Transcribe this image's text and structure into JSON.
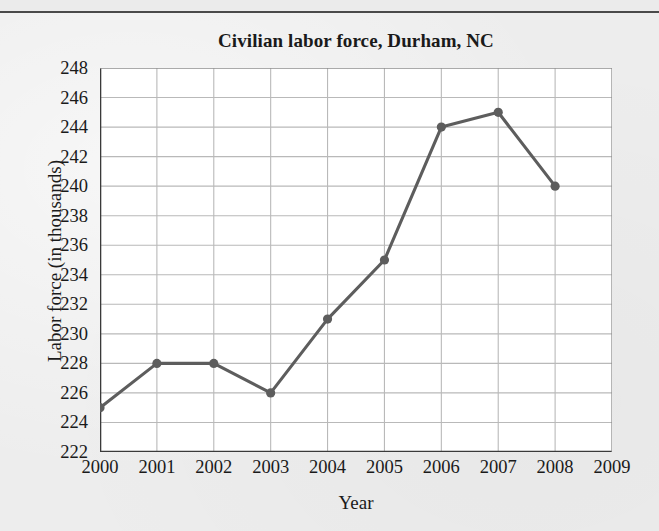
{
  "figure": {
    "background_color": "#ededed",
    "plot_background_color": "#ffffff",
    "axis_color": "#3a3a3a",
    "grid_color": "#b9b9b9",
    "series_color": "#5d5d5d"
  },
  "chart_data": {
    "type": "line",
    "title": "Civilian labor force, Durham, NC",
    "xlabel": "Year",
    "ylabel": "Labor force (in thousands)",
    "x": [
      2000,
      2001,
      2002,
      2003,
      2004,
      2005,
      2006,
      2007,
      2008
    ],
    "values": [
      225,
      228,
      228,
      226,
      231,
      235,
      244,
      245,
      240
    ],
    "series": [
      {
        "name": "Civilian labor force",
        "values": [
          225,
          228,
          228,
          226,
          231,
          235,
          244,
          245,
          240
        ]
      }
    ],
    "xlim": [
      2000,
      2009
    ],
    "ylim": [
      222,
      248
    ],
    "xticks": [
      2000,
      2001,
      2002,
      2003,
      2004,
      2005,
      2006,
      2007,
      2008,
      2009
    ],
    "xtick_labels": [
      "2000",
      "2001",
      "2002",
      "2003",
      "2004",
      "2005",
      "2006",
      "2007",
      "2008",
      "2009"
    ],
    "x_minor_tick_step": 0.5,
    "yticks": [
      222,
      224,
      226,
      228,
      230,
      232,
      234,
      236,
      238,
      240,
      242,
      244,
      246,
      248
    ],
    "ytick_labels": [
      "222",
      "224",
      "226",
      "228",
      "230",
      "232",
      "234",
      "236",
      "238",
      "240",
      "242",
      "244",
      "246",
      "248"
    ],
    "y_minor_tick_step": 1,
    "grid": true,
    "legend": false,
    "marker": "circle",
    "line_color": "#5d5d5d",
    "marker_color": "#5d5d5d"
  }
}
